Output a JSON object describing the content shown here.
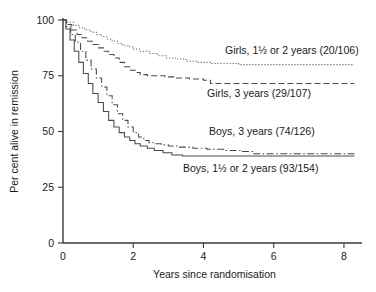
{
  "chart_data": {
    "type": "line",
    "title": "",
    "subtitle": "",
    "xlabel": "Years since randomisation",
    "ylabel": "Per cent alive in remission",
    "xlim": [
      0,
      8.4
    ],
    "ylim": [
      0,
      100
    ],
    "xticks": [
      "0",
      "2",
      "4",
      "6",
      "8"
    ],
    "xtick_values": [
      0,
      2,
      4,
      6,
      8
    ],
    "yticks": [
      "0",
      "25",
      "50",
      "75",
      "100"
    ],
    "ytick_values": [
      0,
      25,
      50,
      75,
      100
    ],
    "grid": false,
    "legend_position": "inline-annotations",
    "series": [
      {
        "name": "Girls, 1½ or 2 years (20/106)",
        "label": "Girls, 1½ or 2 years (20/106)",
        "group": "Girls",
        "treatment": "1½ or 2 years",
        "events": 20,
        "total": 106,
        "linestyle": "dotted",
        "color": "#4a4a4a",
        "label_x": 225,
        "label_y": 54,
        "x": [
          0,
          0.12,
          0.3,
          0.45,
          0.62,
          0.8,
          0.95,
          1.1,
          1.25,
          1.4,
          1.55,
          1.7,
          1.85,
          2.0,
          2.2,
          2.45,
          2.7,
          2.95,
          3.2,
          3.5,
          3.8,
          4.2,
          5.0,
          6.0,
          7.0,
          8.3
        ],
        "y": [
          100,
          99,
          97.5,
          96.5,
          95.5,
          94.5,
          93.5,
          92.5,
          91.5,
          90.5,
          89.5,
          88.5,
          88,
          87,
          86,
          85,
          84,
          83,
          82.5,
          81.5,
          81,
          80.5,
          80,
          80,
          80,
          80
        ]
      },
      {
        "name": "Girls, 3 years (29/107)",
        "label": "Girls, 3 years (29/107)",
        "group": "Girls",
        "treatment": "3 years",
        "events": 29,
        "total": 107,
        "linestyle": "dashed",
        "color": "#4a4a4a",
        "label_x": 207,
        "label_y": 97,
        "x": [
          0,
          0.1,
          0.25,
          0.4,
          0.55,
          0.7,
          0.85,
          1.0,
          1.15,
          1.3,
          1.45,
          1.6,
          1.75,
          1.9,
          2.05,
          2.2,
          2.4,
          2.6,
          2.9,
          3.2,
          3.6,
          4.0,
          4.2,
          5.0,
          6.0,
          7.0,
          8.3
        ],
        "y": [
          100,
          98,
          95.5,
          93.5,
          92,
          90.5,
          89,
          87.5,
          86,
          84.5,
          83,
          81,
          79,
          77.5,
          76.5,
          75.5,
          75,
          75,
          74.5,
          74,
          73.5,
          73,
          71.5,
          71.5,
          71.5,
          71.5,
          71.5
        ]
      },
      {
        "name": "Boys, 3 years (74/126)",
        "label": "Boys, 3 years (74/126)",
        "group": "Boys",
        "treatment": "3 years",
        "events": 74,
        "total": 126,
        "linestyle": "dash-dot",
        "color": "#4a4a4a",
        "label_x": 209,
        "label_y": 135,
        "x": [
          0,
          0.1,
          0.22,
          0.35,
          0.5,
          0.65,
          0.8,
          0.95,
          1.1,
          1.25,
          1.4,
          1.55,
          1.7,
          1.85,
          2.0,
          2.15,
          2.3,
          2.45,
          2.6,
          2.8,
          3.0,
          3.3,
          3.7,
          4.1,
          4.6,
          5.1,
          5.4,
          6.0,
          7.0,
          8.3
        ],
        "y": [
          100,
          97,
          93.5,
          90,
          86,
          82,
          78,
          74,
          70,
          66,
          62,
          58,
          55,
          52,
          49.5,
          47.5,
          46,
          45,
          44.5,
          44,
          43.5,
          43,
          42.5,
          42,
          41.5,
          41,
          40,
          40,
          40,
          40
        ]
      },
      {
        "name": "Boys, 1½ or 2 years (93/154)",
        "label": "Boys, 1½ or 2 years (93/154)",
        "group": "Boys",
        "treatment": "1½ or 2 years",
        "events": 93,
        "total": 154,
        "linestyle": "solid",
        "color": "#4a4a4a",
        "label_x": 183,
        "label_y": 172,
        "x": [
          0,
          0.08,
          0.2,
          0.32,
          0.45,
          0.58,
          0.72,
          0.85,
          1.0,
          1.15,
          1.3,
          1.45,
          1.6,
          1.75,
          1.9,
          2.05,
          2.2,
          2.4,
          2.6,
          2.85,
          3.1,
          3.4,
          3.8,
          4.3,
          5.0,
          6.0,
          7.0,
          8.3
        ],
        "y": [
          100,
          96,
          91,
          86,
          81,
          76,
          71.5,
          67,
          63,
          59,
          55,
          52,
          49.5,
          47.5,
          46,
          44.5,
          43.5,
          42.5,
          41.5,
          40.5,
          39.5,
          39,
          39,
          39,
          39,
          39,
          39,
          39
        ]
      }
    ]
  },
  "geometry": {
    "plot_left": 63,
    "plot_right": 358,
    "plot_top": 20,
    "plot_bottom": 243
  }
}
